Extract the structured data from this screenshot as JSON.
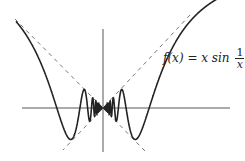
{
  "chart_data": {
    "type": "line",
    "title": "",
    "function": "f(x) = x sin(1/x)",
    "series": [
      {
        "name": "f(x) = x sin 1/x",
        "style": "solid",
        "color": "#222222"
      },
      {
        "name": "y = x",
        "style": "dashed",
        "color": "#555555"
      },
      {
        "name": "y = -x",
        "style": "dashed",
        "color": "#555555"
      }
    ],
    "xlim": [
      -0.6,
      0.87
    ],
    "ylim": [
      -0.3,
      0.62
    ],
    "xlabel": "",
    "ylabel": "",
    "axes": {
      "ticks": false,
      "grid": false,
      "origin_px": [
        103,
        108
      ],
      "scale_px_per_unit": 145
    },
    "annotations": [
      "f(x) = x sin 1/x"
    ]
  },
  "label": {
    "lhs": "f(x) = x sin",
    "num": "1",
    "den": "x"
  },
  "colors": {
    "curve": "#222222",
    "axis": "#444444",
    "dashed": "#666666",
    "background": "#ffffff"
  }
}
